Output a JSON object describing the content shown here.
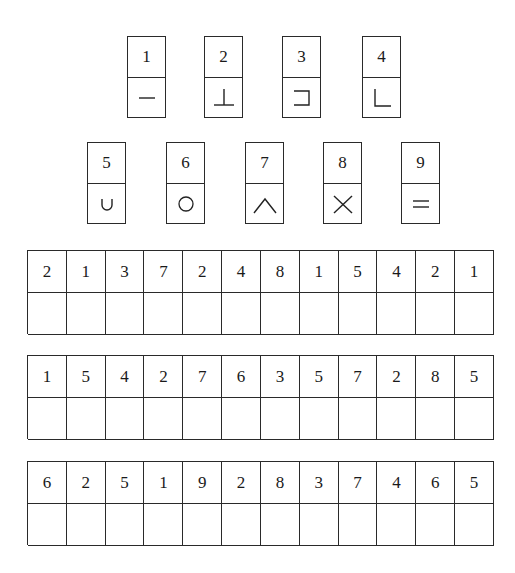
{
  "key": [
    {
      "digit": "1",
      "symbol": "horizontal-line"
    },
    {
      "digit": "2",
      "symbol": "up-tack"
    },
    {
      "digit": "3",
      "symbol": "right-bracket"
    },
    {
      "digit": "4",
      "symbol": "l-corner"
    },
    {
      "digit": "5",
      "symbol": "cup"
    },
    {
      "digit": "6",
      "symbol": "circle"
    },
    {
      "digit": "7",
      "symbol": "caret"
    },
    {
      "digit": "8",
      "symbol": "cross"
    },
    {
      "digit": "9",
      "symbol": "equals"
    }
  ],
  "grids": [
    {
      "digits": [
        "2",
        "1",
        "3",
        "7",
        "2",
        "4",
        "8",
        "1",
        "5",
        "4",
        "2",
        "1"
      ],
      "answers": [
        "",
        "",
        "",
        "",
        "",
        "",
        "",
        "",
        "",
        "",
        "",
        ""
      ]
    },
    {
      "digits": [
        "1",
        "5",
        "4",
        "2",
        "7",
        "6",
        "3",
        "5",
        "7",
        "2",
        "8",
        "5"
      ],
      "answers": [
        "",
        "",
        "",
        "",
        "",
        "",
        "",
        "",
        "",
        "",
        "",
        ""
      ]
    },
    {
      "digits": [
        "6",
        "2",
        "5",
        "1",
        "9",
        "2",
        "8",
        "3",
        "7",
        "4",
        "6",
        "5"
      ],
      "answers": [
        "",
        "",
        "",
        "",
        "",
        "",
        "",
        "",
        "",
        "",
        "",
        ""
      ]
    }
  ]
}
